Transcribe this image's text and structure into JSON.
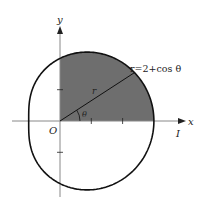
{
  "diagram": {
    "type": "polar-curve",
    "curve_equation": "r=2+cos θ",
    "labels": {
      "x_axis": "x",
      "y_axis": "y",
      "origin": "O",
      "radius": "r",
      "angle": "θ",
      "region": "I",
      "equation": "r=2+cos θ"
    },
    "geometry": {
      "origin_px": [
        60,
        121
      ],
      "px_per_unit": 31.3,
      "ray_angle_deg": 33,
      "x_ticks": [
        1,
        2
      ],
      "y_ticks": [
        1,
        -1
      ]
    },
    "shaded_region": {
      "description": "First-quadrant area inside curve",
      "theta_range": [
        0,
        90
      ],
      "fill": "#6e6e6e"
    },
    "colors": {
      "curve": "#111111",
      "axes": "#888888",
      "shade": "#6e6e6e"
    }
  }
}
